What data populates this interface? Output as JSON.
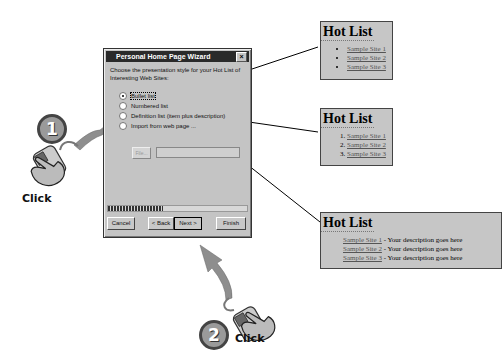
{
  "dialog": {
    "title": "Personal Home Page Wizard",
    "close_glyph": "×",
    "prompt": "Choose the presentation style for your Hot List of Interesting Web Sites:",
    "options": [
      {
        "label": "Bullet list",
        "selected": true
      },
      {
        "label": "Numbered list",
        "selected": false
      },
      {
        "label": "Definition list (item plus description)",
        "selected": false
      },
      {
        "label": "Import from web page ...",
        "selected": false
      }
    ],
    "file_button": "File...",
    "file_input_value": "",
    "buttons": {
      "cancel": "Cancel",
      "back": "< Back",
      "next": "Next >",
      "finish": "Finish"
    }
  },
  "previews": {
    "bullet": {
      "title": "Hot List",
      "items": [
        "Sample Site 1",
        "Sample Site 2",
        "Sample Site 3"
      ]
    },
    "numbered": {
      "title": "Hot List",
      "items": [
        "Sample Site 1",
        "Sample Site 2",
        "Sample Site 3"
      ]
    },
    "definition": {
      "title": "Hot List",
      "items": [
        {
          "site": "Sample Site 1",
          "desc": " - Your description goes here"
        },
        {
          "site": "Sample Site 2",
          "desc": " - Your description goes here"
        },
        {
          "site": "Sample Site 3",
          "desc": " - Your description goes here"
        }
      ]
    }
  },
  "steps": [
    {
      "number": "1",
      "action": "Click"
    },
    {
      "number": "2",
      "action": "Click"
    }
  ]
}
